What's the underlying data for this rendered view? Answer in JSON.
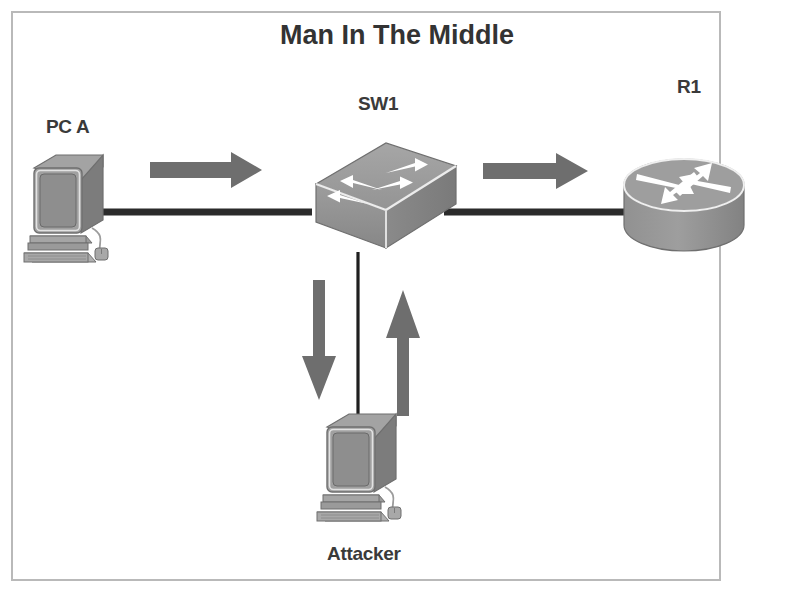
{
  "diagram": {
    "title": "Man In The Middle",
    "border_color": "#b9b9b9",
    "background": "#ffffff",
    "nodes": [
      {
        "id": "pc-a",
        "label": "PC A",
        "type": "desktop-computer",
        "x": 66,
        "y": 205
      },
      {
        "id": "sw1",
        "label": "SW1",
        "type": "switch",
        "x": 372,
        "y": 200
      },
      {
        "id": "r1",
        "label": "R1",
        "type": "router",
        "x": 684,
        "y": 185
      },
      {
        "id": "attacker",
        "label": "Attacker",
        "type": "desktop-computer",
        "x": 358,
        "y": 465
      }
    ],
    "links": [
      {
        "id": "link-pca-sw1",
        "from": "pc-a",
        "to": "sw1",
        "orientation": "horizontal",
        "style": "thick"
      },
      {
        "id": "link-sw1-r1",
        "from": "sw1",
        "to": "r1",
        "orientation": "horizontal",
        "style": "thick"
      },
      {
        "id": "link-sw1-attacker",
        "from": "sw1",
        "to": "attacker",
        "orientation": "vertical",
        "style": "thin"
      }
    ],
    "flow_arrows": [
      {
        "id": "arrow-pca-to-sw1",
        "direction": "right",
        "color": "#6e6e6e"
      },
      {
        "id": "arrow-sw1-to-r1",
        "direction": "right",
        "color": "#6e6e6e"
      },
      {
        "id": "arrow-sw1-to-attacker",
        "direction": "down",
        "color": "#6e6e6e"
      },
      {
        "id": "arrow-attacker-to-sw1",
        "direction": "up",
        "color": "#6e6e6e"
      }
    ],
    "colors": {
      "device_fill": "#9a9a9a",
      "device_shade": "#7e7e7e",
      "device_light": "#b0b0b0",
      "arrow_gray": "#6e6e6e",
      "cable": "#2b2b2b",
      "text": "#3a3a3a",
      "icon_arrow": "#ffffff"
    }
  }
}
